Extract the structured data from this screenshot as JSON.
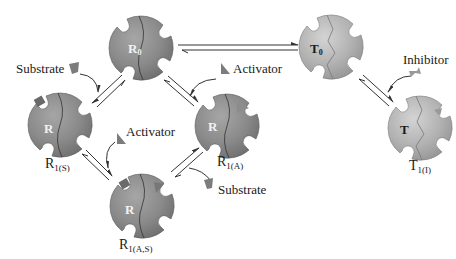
{
  "diagram": {
    "type": "allosteric-regulation-model",
    "colors": {
      "r_state_fill": "#8a8a8a",
      "r_state_light": "#b4b4b4",
      "t_state_fill": "#a9a9a9",
      "t_state_light": "#d2d2d2",
      "ligand": "#7c7c7c",
      "arrow": "#333333",
      "text": "#1a1a1a",
      "inner_text_r": "#f2f2f2",
      "inner_text_t": "#1a1a1a"
    },
    "nodes": [
      {
        "id": "R0",
        "inner": "R",
        "inner_sub": "0",
        "label": "",
        "label_sub": ""
      },
      {
        "id": "T0",
        "inner": "T",
        "inner_sub": "0",
        "label": "",
        "label_sub": ""
      },
      {
        "id": "R1S",
        "inner": "R",
        "inner_sub": "",
        "label": "R",
        "label_sub": "1(S)"
      },
      {
        "id": "R1A",
        "inner": "R",
        "inner_sub": "",
        "label": "R",
        "label_sub": "1(A)"
      },
      {
        "id": "R1AS",
        "inner": "R",
        "inner_sub": "",
        "label": "R",
        "label_sub": "1(A,S)"
      },
      {
        "id": "T1I",
        "inner": "T",
        "inner_sub": "",
        "label": "T",
        "label_sub": "1(I)"
      }
    ],
    "ligand_labels": {
      "substrate_top_left": "Substrate",
      "activator_top_right": "Activator",
      "activator_middle": "Activator",
      "substrate_bottom_right": "Substrate",
      "inhibitor": "Inhibitor"
    },
    "equilibria": [
      {
        "from": "R0",
        "to": "T0"
      },
      {
        "from": "R0",
        "to": "R1S"
      },
      {
        "from": "R0",
        "to": "R1A"
      },
      {
        "from": "R1S",
        "to": "R1AS"
      },
      {
        "from": "R1A",
        "to": "R1AS"
      },
      {
        "from": "T0",
        "to": "T1I"
      }
    ]
  }
}
